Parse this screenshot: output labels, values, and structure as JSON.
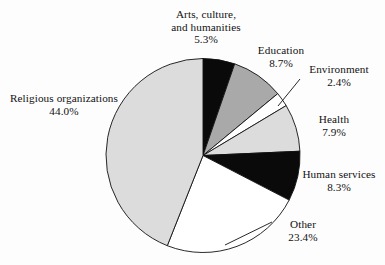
{
  "chart_data": {
    "type": "pie",
    "title": "",
    "subtitle": "",
    "xlabel": "",
    "ylabel": "",
    "legend_position": "outside-labels",
    "grid": false,
    "units": "percent",
    "start_angle_deg": 0,
    "direction": "clockwise",
    "categories": [
      "Arts, culture, and humanities",
      "Education",
      "Environment",
      "Health",
      "Human services",
      "Other",
      "Religious organizations"
    ],
    "values": [
      5.3,
      8.7,
      2.4,
      7.9,
      8.3,
      23.4,
      44.0
    ],
    "slices": [
      {
        "id": "arts",
        "label_line_1": "Arts, culture,",
        "label_line_2": "and humanities",
        "percent_text": "5.3%",
        "value": 5.3,
        "color": "#0a0a0a",
        "stroke": "#111111",
        "has_leader_line": false
      },
      {
        "id": "education",
        "label_line_1": "Education",
        "label_line_2": "",
        "percent_text": "8.7%",
        "value": 8.7,
        "color": "#a9a9a9",
        "stroke": "#111111",
        "has_leader_line": false
      },
      {
        "id": "environment",
        "label_line_1": "Environment",
        "label_line_2": "",
        "percent_text": "2.4%",
        "value": 2.4,
        "color": "#ffffff",
        "stroke": "#111111",
        "has_leader_line": true
      },
      {
        "id": "health",
        "label_line_1": "Health",
        "label_line_2": "",
        "percent_text": "7.9%",
        "value": 7.9,
        "color": "#dcdcdc",
        "stroke": "#111111",
        "has_leader_line": false
      },
      {
        "id": "human-services",
        "label_line_1": "Human services",
        "label_line_2": "",
        "percent_text": "8.3%",
        "value": 8.3,
        "color": "#0a0a0a",
        "stroke": "#111111",
        "has_leader_line": false
      },
      {
        "id": "other",
        "label_line_1": "Other",
        "label_line_2": "",
        "percent_text": "23.4%",
        "value": 23.4,
        "color": "#ffffff",
        "stroke": "#111111",
        "has_leader_line": true
      },
      {
        "id": "religious-organizations",
        "label_line_1": "Religious organizations",
        "label_line_2": "",
        "percent_text": "44.0%",
        "value": 44.0,
        "color": "#dcdcdc",
        "stroke": "#111111",
        "has_leader_line": false
      }
    ],
    "background_color": "#fdfdfd"
  }
}
